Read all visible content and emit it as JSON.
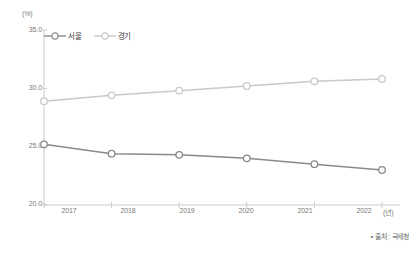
{
  "chart_data": {
    "type": "line",
    "title": "",
    "subtitle": "",
    "xlabel": "(년)",
    "ylabel": "(%)",
    "x": [
      "2017",
      "2018",
      "2019",
      "2020",
      "2021",
      "2022"
    ],
    "categories": [
      "2017",
      "2018",
      "2019",
      "2020",
      "2021",
      "2022"
    ],
    "series": [
      {
        "name": "서울",
        "values": [
          25.2,
          24.4,
          24.3,
          24.0,
          23.5,
          23.0
        ],
        "color": "#8a8a8a",
        "marker": "open-circle"
      },
      {
        "name": "경기",
        "values": [
          28.9,
          29.4,
          29.8,
          30.2,
          30.6,
          30.8
        ],
        "color": "#c9c9c9",
        "marker": "open-circle"
      }
    ],
    "ylim": [
      20.0,
      35.0
    ],
    "y_ticks": [
      20.0,
      25.0,
      30.0,
      35.0
    ],
    "y_tick_labels": [
      "20.0",
      "25.0",
      "30.0",
      "35.0"
    ],
    "grid": false,
    "legend_position": "top-left-inside"
  },
  "axis": {
    "y_unit": "(%)",
    "x_unit": "(년)",
    "y_tick_labels": [
      "35.0",
      "30.0",
      "25.0",
      "20.0"
    ],
    "x_tick_labels": [
      "2017",
      "2018",
      "2019",
      "2020",
      "2021",
      "2022"
    ]
  },
  "legend": {
    "items": [
      {
        "label": "서울",
        "color": "#8a8a8a"
      },
      {
        "label": "경기",
        "color": "#c9c9c9"
      }
    ]
  },
  "footer": {
    "source": "• 출처 : 국세청"
  }
}
